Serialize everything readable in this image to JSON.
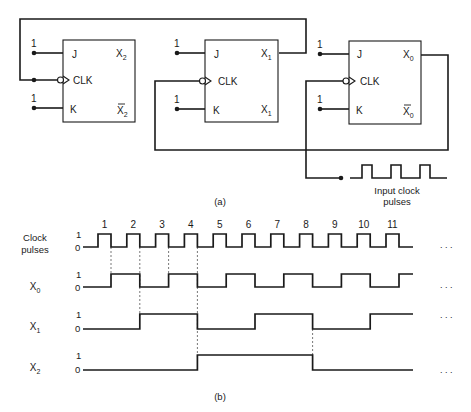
{
  "part_a": {
    "caption": "(a)",
    "flip_flops": [
      {
        "id": "ff2",
        "j": "J",
        "clk": "CLK",
        "k": "K",
        "q": "X",
        "q_sub": "2",
        "qbar": "X",
        "qbar_sub": "2",
        "qbar_overbar": true,
        "j_level": "1",
        "k_level": "1"
      },
      {
        "id": "ff1",
        "j": "J",
        "clk": "CLK",
        "k": "K",
        "q": "X",
        "q_sub": "1",
        "qbar": "X",
        "qbar_sub": "1",
        "qbar_overbar": false,
        "j_level": "1",
        "k_level": "1"
      },
      {
        "id": "ff0",
        "j": "J",
        "clk": "CLK",
        "k": "K",
        "q": "X",
        "q_sub": "0",
        "qbar": "X",
        "qbar_sub": "0",
        "qbar_overbar": true,
        "j_level": "1",
        "k_level": "1"
      }
    ],
    "input_label_line1": "Input clock",
    "input_label_line2": "pulses"
  },
  "part_b": {
    "caption": "(b)",
    "ellipsis": ". . .",
    "signals": [
      {
        "name": "Clock",
        "name2": "pulses",
        "sub": "",
        "hi": "1",
        "lo": "0"
      },
      {
        "name": "X",
        "name2": "",
        "sub": "0",
        "hi": "1",
        "lo": "0"
      },
      {
        "name": "X",
        "name2": "",
        "sub": "1",
        "hi": "1",
        "lo": "0"
      },
      {
        "name": "X",
        "name2": "",
        "sub": "2",
        "hi": "1",
        "lo": "0"
      }
    ],
    "pulse_numbers": [
      "1",
      "2",
      "3",
      "4",
      "5",
      "6",
      "7",
      "8",
      "9",
      "10",
      "11"
    ]
  },
  "chart_data": {
    "type": "timing",
    "title": "",
    "pulses": 11,
    "series": [
      {
        "name": "Clock pulses",
        "description": "11 positive pulses; counter triggers on falling edges"
      },
      {
        "name": "X0",
        "values_after_each_falling_edge": [
          1,
          0,
          1,
          0,
          1,
          0,
          1,
          0,
          1,
          0,
          1
        ],
        "initial": 0
      },
      {
        "name": "X1",
        "values_after_each_falling_edge": [
          0,
          1,
          1,
          0,
          0,
          1,
          1,
          0,
          0,
          1,
          1
        ],
        "initial": 0
      },
      {
        "name": "X2",
        "values_after_each_falling_edge": [
          0,
          0,
          0,
          1,
          1,
          1,
          1,
          0,
          0,
          0,
          0
        ],
        "initial": 0
      }
    ],
    "dashed_markers_at_falling_edges": [
      1,
      2,
      3,
      4,
      8
    ]
  }
}
